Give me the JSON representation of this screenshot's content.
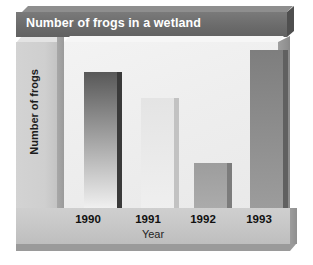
{
  "chart_data": {
    "type": "bar",
    "title": "Number of frogs in a wetland",
    "xlabel": "Year",
    "ylabel": "Number of frogs",
    "categories": [
      "1990",
      "1991",
      "1992",
      "1993"
    ],
    "values": [
      136,
      110,
      45,
      158
    ],
    "value_unit": "relative bar height (pixels; no numeric y-axis scale shown)",
    "ylim": [
      0,
      166
    ],
    "grid": false,
    "legend": null,
    "axis_tick_labels": {
      "x": [
        "1990",
        "1991",
        "1992",
        "1993"
      ],
      "y": []
    },
    "series": [
      {
        "name": "Number of frogs",
        "values": [
          136,
          110,
          45,
          158
        ]
      }
    ],
    "bar_styles": [
      {
        "category": "1990",
        "top_color": "#585858",
        "bottom_color": "#f0f0f0",
        "side_color": "#3a3a3a"
      },
      {
        "category": "1991",
        "top_color": "#e4e4e4",
        "bottom_color": "#efefef",
        "side_color": "#c2c2c2"
      },
      {
        "category": "1992",
        "top_color": "#9d9d9d",
        "bottom_color": "#ababab",
        "side_color": "#7c7c7c"
      },
      {
        "category": "1993",
        "top_color": "#7e7e7e",
        "bottom_color": "#9c9c9c",
        "side_color": "#606060"
      }
    ],
    "style": {
      "rendering": "3d-isometric",
      "title_bar_color": "#6e6e6e",
      "title_text_color": "#ffffff",
      "plot_background": "#efefef",
      "floor_color": "#c9c9c9",
      "panel_color": "#cfcfcf",
      "text_color": "#111111"
    }
  }
}
